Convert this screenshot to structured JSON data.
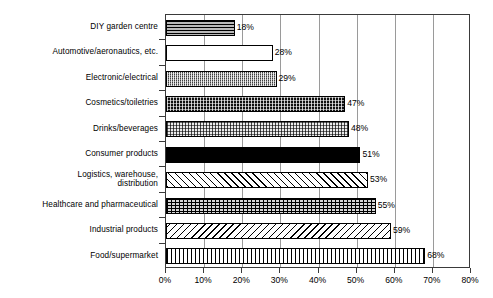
{
  "chart_data": {
    "type": "bar",
    "orientation": "horizontal",
    "title": "",
    "xlabel": "",
    "ylabel": "",
    "xlim": [
      0,
      80
    ],
    "xtick_labels": [
      "0%",
      "10%",
      "20%",
      "30%",
      "40%",
      "50%",
      "60%",
      "70%",
      "80%"
    ],
    "xtick_values": [
      0,
      10,
      20,
      30,
      40,
      50,
      60,
      70,
      80
    ],
    "grid": true,
    "grid_axis": "x",
    "legend": "none",
    "value_label_suffix": "%",
    "categories": [
      "DIY garden centre",
      "Automotive/aeronautics, etc.",
      "Electronic/electrical",
      "Cosmetics/toiletries",
      "Drinks/beverages",
      "Consumer products",
      "Logistics, warehouse,\ndistribution",
      "Healthcare and pharmaceutical",
      "Industrial products",
      "Food/supermarket"
    ],
    "values": [
      18,
      28,
      29,
      47,
      48,
      51,
      53,
      55,
      59,
      68
    ],
    "value_labels": [
      "18%",
      "28%",
      "29%",
      "47%",
      "48%",
      "51%",
      "53%",
      "55%",
      "59%",
      "68%"
    ],
    "bar_patterns": [
      "horizontal-lines",
      "blank-white",
      "checkered-medium-gray",
      "dotted-dark",
      "dotted-light",
      "solid-black",
      "diagonal-hatch-forward",
      "crosshatch-grid",
      "diagonal-hatch-backward",
      "vertical-lines"
    ],
    "colors": {
      "axis": "#3a3a3a",
      "gridline": "#9a9a9a",
      "bar_outline": "#000000",
      "text": "#000000",
      "background": "#ffffff"
    }
  }
}
